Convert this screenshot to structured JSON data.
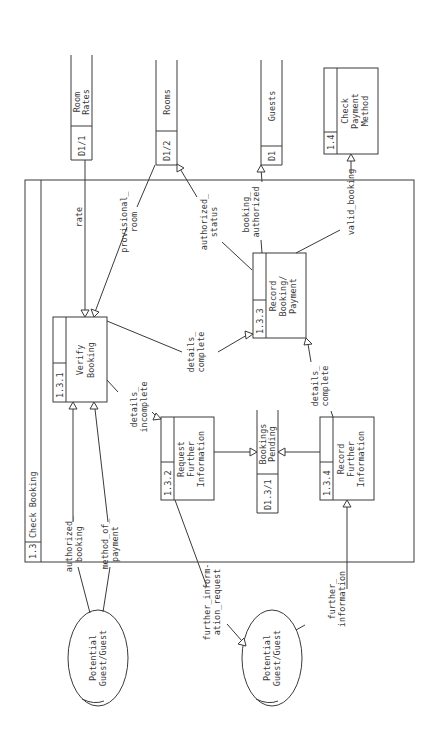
{
  "diagram": {
    "type": "data-flow-diagram",
    "orientation": "rotated-90-ccw",
    "frame": {
      "id": "1.3",
      "title": "Check Booking"
    },
    "processes": [
      {
        "key": "verify",
        "id": "1.3.1",
        "lines": [
          "Verify",
          "Booking"
        ]
      },
      {
        "key": "request",
        "id": "1.3.2",
        "lines": [
          "Request",
          "Further",
          "Information"
        ]
      },
      {
        "key": "record_booking",
        "id": "1.3.3",
        "lines": [
          "Record",
          "Booking/",
          "Payment"
        ]
      },
      {
        "key": "record_info",
        "id": "1.3.4",
        "lines": [
          "Record",
          "Further",
          "Information"
        ]
      },
      {
        "key": "check_payment",
        "id": "1.4",
        "lines": [
          "Check",
          "Payment",
          "Method"
        ]
      }
    ],
    "data_stores": [
      {
        "key": "room_rates",
        "id": "D1/1",
        "lines": [
          "Room",
          "Rates"
        ]
      },
      {
        "key": "rooms",
        "id": "D1/2",
        "lines": [
          "Rooms"
        ]
      },
      {
        "key": "guests",
        "id": "D1",
        "lines": [
          "Guests"
        ]
      },
      {
        "key": "bookings_pending",
        "id": "D1.3/1",
        "lines": [
          "Bookings",
          "Pending"
        ]
      }
    ],
    "external_entities": [
      {
        "key": "guest_a",
        "lines": [
          "Potential",
          "Guest/Guest"
        ]
      },
      {
        "key": "guest_b",
        "lines": [
          "Potential",
          "Guest/Guest"
        ]
      }
    ],
    "flows": [
      {
        "key": "rate",
        "from": "D1/1",
        "to": "1.3.1",
        "lines": [
          "rate"
        ]
      },
      {
        "key": "provisional_room",
        "from": "D1/2",
        "to": "1.3.1",
        "lines": [
          "provisional_",
          "room"
        ]
      },
      {
        "key": "authorized_status",
        "from": "1.3.3",
        "to": "D1/2",
        "lines": [
          "authorized_",
          "status"
        ]
      },
      {
        "key": "booking_authorized",
        "from": "1.3.3",
        "to": "D1",
        "lines": [
          "booking_",
          "authorized"
        ]
      },
      {
        "key": "valid_booking",
        "from": "1.3.3",
        "to": "1.4",
        "lines": [
          "valid_booking"
        ]
      },
      {
        "key": "details_complete_1",
        "from": "1.3.1",
        "to": "1.3.3",
        "lines": [
          "details_",
          "complete"
        ]
      },
      {
        "key": "details_incomplete",
        "from": "1.3.1",
        "to": "1.3.2",
        "lines": [
          "details_",
          "incomplete"
        ]
      },
      {
        "key": "authorized_booking",
        "from": "Potential Guest/Guest",
        "to": "1.3.1",
        "lines": [
          "authorized_",
          "booking"
        ]
      },
      {
        "key": "method_of_payment",
        "from": "Potential Guest/Guest",
        "to": "1.3.1",
        "lines": [
          "method_of_",
          "payment"
        ]
      },
      {
        "key": "to_pending_1",
        "from": "1.3.2",
        "to": "D1.3/1",
        "lines": []
      },
      {
        "key": "to_pending_2",
        "from": "1.3.4",
        "to": "D1.3/1",
        "lines": []
      },
      {
        "key": "details_complete_2",
        "from": "1.3.4",
        "to": "1.3.3",
        "lines": [
          "details_",
          "complete"
        ]
      },
      {
        "key": "further_information_request",
        "from": "1.3.2",
        "to": "Potential Guest/Guest",
        "lines": [
          "further_inform-",
          "ation_request"
        ]
      },
      {
        "key": "further_information",
        "from": "Potential Guest/Guest",
        "to": "1.3.4",
        "lines": [
          "further_",
          "information"
        ]
      }
    ]
  }
}
